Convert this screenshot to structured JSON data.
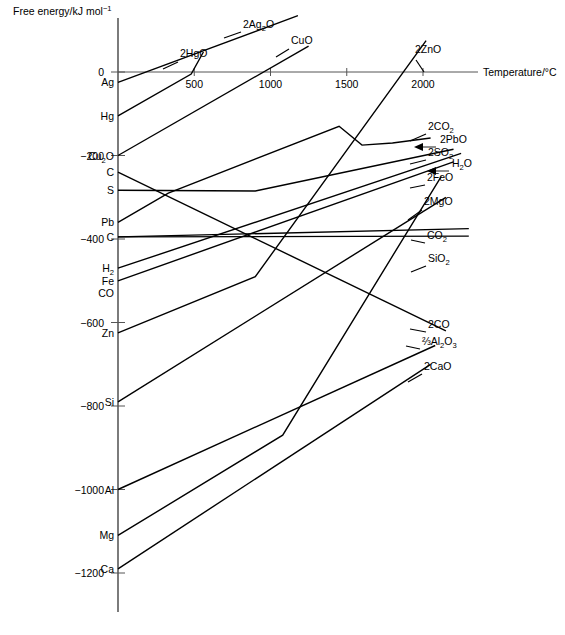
{
  "chart_data": {
    "type": "line",
    "title": "",
    "ylabel": "Free energy/kJ mol",
    "ylabel_sup": "−1",
    "xlabel": "Temperature/°C",
    "xlim": [
      0,
      2300
    ],
    "ylim": [
      -1260,
      120
    ],
    "grid": false,
    "legend": "inline-right-labels",
    "xticks": [
      500,
      1000,
      1500,
      2000
    ],
    "xtick_labels": [
      "500",
      "1000",
      "1500",
      "2000"
    ],
    "yticks": [
      0,
      -200,
      -400,
      -600,
      -800,
      -1000,
      -1200
    ],
    "ytick_labels": [
      "0",
      "−200",
      "−400",
      "−600",
      "−800",
      "−1000",
      "−1200"
    ],
    "element_labels": [
      {
        "text": "Ag",
        "value": -25
      },
      {
        "text": "Hg",
        "value": -105
      },
      {
        "text": "Cu",
        "sub": "2",
        "tail": "O",
        "value": -200
      },
      {
        "text": "C",
        "value": -240
      },
      {
        "text": "S",
        "value": -283
      },
      {
        "text": "Pb",
        "value": -360
      },
      {
        "text": "C",
        "value": -395
      },
      {
        "text": "H",
        "sub": "2",
        "value": -470
      },
      {
        "text": "Fe",
        "value": -500
      },
      {
        "text": "CO",
        "value": -530
      },
      {
        "text": "Zn",
        "value": -625
      },
      {
        "text": "Si",
        "value": -790
      },
      {
        "text": "Al",
        "value": -1000
      },
      {
        "text": "Mg",
        "value": -1110
      },
      {
        "text": "Ca",
        "value": -1190
      }
    ],
    "series": [
      {
        "name": "2Ag2O",
        "label": "2Ag",
        "label_sub": "2",
        "label_tail": "O",
        "label_xy": [
          243,
          28
        ],
        "points": [
          [
            0,
            -25
          ],
          [
            1180,
            135
          ]
        ]
      },
      {
        "name": "2HgO",
        "label": "2HgO",
        "label_xy": [
          180,
          57
        ],
        "points": [
          [
            0,
            -105
          ],
          [
            480,
            -5
          ],
          [
            560,
            48
          ]
        ]
      },
      {
        "name": "CuO",
        "label": "CuO",
        "label_xy": [
          291,
          44
        ],
        "points": [
          [
            0,
            -200
          ],
          [
            1250,
            62
          ]
        ]
      },
      {
        "name": "2ZnO",
        "label": "2ZnO",
        "label_xy": [
          415,
          53
        ],
        "points": [
          [
            0,
            -625
          ],
          [
            900,
            -490
          ],
          [
            2020,
            75
          ]
        ]
      },
      {
        "name": "2CO2",
        "label": "2CO",
        "label_sub": "2",
        "label_xy": [
          428,
          130
        ],
        "points": [
          [
            0,
            -395
          ],
          [
            2300,
            -375
          ]
        ]
      },
      {
        "name": "2PbO",
        "label": "2PbO",
        "label_xy": [
          440,
          143
        ],
        "points": [
          [
            0,
            -360
          ],
          [
            330,
            -290
          ],
          [
            1450,
            -130
          ],
          [
            1600,
            -175
          ],
          [
            1800,
            -170
          ],
          [
            2050,
            -158
          ]
        ]
      },
      {
        "name": "2SO2",
        "label": "2SO",
        "label_sub": "2",
        "label_xy": [
          428,
          156
        ],
        "points": [
          [
            0,
            -283
          ],
          [
            900,
            -285
          ],
          [
            2200,
            -185
          ]
        ]
      },
      {
        "name": "H2O",
        "label": "H",
        "label_sub": "2",
        "label_tail": "O",
        "label_xy": [
          452,
          167
        ],
        "points": [
          [
            0,
            -470
          ],
          [
            2250,
            -195
          ]
        ]
      },
      {
        "name": "2FeO",
        "label": "2FeO",
        "label_xy": [
          427,
          181
        ],
        "points": [
          [
            0,
            -500
          ],
          [
            2200,
            -215
          ]
        ]
      },
      {
        "name": "2MgO",
        "label": "2MgO",
        "label_xy": [
          424,
          205
        ],
        "points": [
          [
            0,
            -1110
          ],
          [
            1080,
            -870
          ],
          [
            2120,
            -250
          ]
        ]
      },
      {
        "name": "CO2",
        "label": "CO",
        "label_sub": "2",
        "label_xy": [
          427,
          239
        ],
        "points": [
          [
            0,
            -395
          ],
          [
            2300,
            -393
          ]
        ]
      },
      {
        "name": "SiO2",
        "label": "SiO",
        "label_sub": "2",
        "label_xy": [
          428,
          262
        ],
        "points": [
          [
            0,
            -790
          ],
          [
            2150,
            -300
          ]
        ]
      },
      {
        "name": "2CO",
        "label": "2CO",
        "label_xy": [
          428,
          328
        ],
        "points": [
          [
            0,
            -240
          ],
          [
            2150,
            -620
          ]
        ]
      },
      {
        "name": "Al2O3",
        "label": "⅔Al",
        "label_sub": "2",
        "label_tail": "O",
        "label_tail_sub": "3",
        "label_xy": [
          422,
          345
        ],
        "points": [
          [
            0,
            -1000
          ],
          [
            2080,
            -655
          ]
        ]
      },
      {
        "name": "2CaO",
        "label": "2CaO",
        "label_xy": [
          424,
          370
        ],
        "points": [
          [
            0,
            -1190
          ],
          [
            2050,
            -700
          ]
        ]
      }
    ],
    "leaders": [
      {
        "name": "2Ag2O-leader",
        "from": [
          241,
          32
        ],
        "to": [
          224,
          38
        ]
      },
      {
        "name": "2HgO-leader",
        "from": [
          178,
          62
        ],
        "to": [
          163,
          69
        ]
      },
      {
        "name": "CuO-leader",
        "from": [
          289,
          49
        ],
        "to": [
          276,
          57
        ]
      },
      {
        "name": "2ZnO-leader",
        "from": [
          416,
          60
        ],
        "to": [
          424,
          72
        ]
      },
      {
        "name": "2CO2-leader",
        "from": [
          426,
          134
        ],
        "to": [
          410,
          141
        ]
      },
      {
        "name": "2SO2-leader",
        "from": [
          426,
          160
        ],
        "to": [
          410,
          164
        ]
      },
      {
        "name": "2FeO-leader",
        "from": [
          425,
          185
        ],
        "to": [
          410,
          188
        ]
      },
      {
        "name": "2MgO-leader",
        "from": [
          422,
          210
        ],
        "to": [
          408,
          220
        ]
      },
      {
        "name": "CO2-leader",
        "from": [
          425,
          243
        ],
        "to": [
          411,
          240
        ]
      },
      {
        "name": "SiO2-leader",
        "from": [
          426,
          266
        ],
        "to": [
          411,
          272
        ]
      },
      {
        "name": "2CO-leader",
        "from": [
          426,
          332
        ],
        "to": [
          410,
          329
        ]
      },
      {
        "name": "Al2O3-leader",
        "from": [
          420,
          349
        ],
        "to": [
          406,
          346
        ]
      },
      {
        "name": "2CaO-leader",
        "from": [
          422,
          374
        ],
        "to": [
          408,
          382
        ]
      }
    ],
    "arrows": [
      {
        "name": "2PbO-arrow",
        "tail": [
          436,
          147
        ],
        "head": [
          414,
          147
        ]
      },
      {
        "name": "H2O-arrow",
        "tail": [
          449,
          171
        ],
        "head": [
          427,
          171
        ]
      }
    ]
  }
}
